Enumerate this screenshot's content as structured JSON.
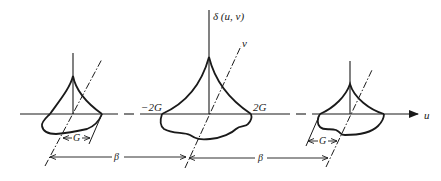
{
  "figure": {
    "labels": {
      "delta": "δ (u, v)",
      "v_axis": "v",
      "u_axis": "u",
      "minus_2g": "−2G",
      "plus_2g": "2G",
      "g_left": "G",
      "g_right": "G",
      "beta_left": "β",
      "beta_right": "β"
    },
    "colors": {
      "stroke": "#1a1a1a",
      "background": "#ffffff"
    }
  }
}
